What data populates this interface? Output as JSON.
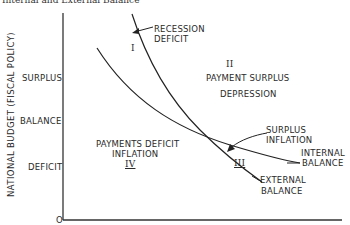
{
  "title": "Internal and External Balance",
  "axes": {
    "y_label": "NATIONAL BUDGET (FISCAL POLICY)",
    "y_ticks": [
      "SURPLUS",
      "BALANCE",
      "DEFICIT"
    ],
    "origin": "O"
  },
  "curves": {
    "internal": {
      "label_line1": "INTERNAL",
      "label_line2": "BALANCE"
    },
    "external": {
      "label_line1": "EXTERNAL",
      "label_line2": "BALANCE"
    }
  },
  "regions": {
    "r1": {
      "numeral": "I",
      "line1": "RECESSION",
      "line2": "DEFICIT"
    },
    "r2": {
      "numeral": "II",
      "line1": "PAYMENT SURPLUS",
      "line2": "DEPRESSION"
    },
    "r3": {
      "numeral": "III",
      "line1": "SURPLUS",
      "line2": "INFLATION"
    },
    "r4": {
      "numeral": "IV",
      "line1": "PAYMENTS DEFICIT",
      "line2": "INFLATION"
    }
  },
  "colors": {
    "ink": "#2a2a2a",
    "background": "#ffffff"
  }
}
